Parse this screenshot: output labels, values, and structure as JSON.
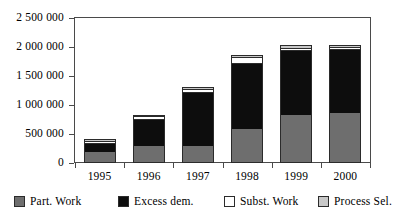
{
  "chart_data": {
    "type": "bar",
    "subtype": "stacked-bar",
    "title": "",
    "xlabel": "",
    "ylabel": "",
    "categories": [
      "1995",
      "1996",
      "1997",
      "1998",
      "1999",
      "2000"
    ],
    "ylim": [
      0,
      2500000
    ],
    "yticks": [
      0,
      500000,
      1000000,
      1500000,
      2000000,
      2500000
    ],
    "ytick_labels": [
      "0",
      "500 000",
      "1 000 000",
      "1 500 000",
      "2 000 000",
      "2 500 000"
    ],
    "grid": false,
    "legend_position": "bottom",
    "series": [
      {
        "name": "Part. Work",
        "color": "#6e6e6e",
        "values": [
          190000,
          300000,
          290000,
          590000,
          830000,
          870000
        ]
      },
      {
        "name": "Excess dem.",
        "color": "#0d0d0d",
        "values": [
          160000,
          460000,
          930000,
          1140000,
          1120000,
          1090000
        ]
      },
      {
        "name": "Subst. Work",
        "color": "#ffffff",
        "values": [
          30000,
          45000,
          60000,
          105000,
          40000,
          35000
        ]
      },
      {
        "name": "Process Sel.",
        "color": "#c8c8c8",
        "values": [
          30000,
          30000,
          25000,
          25000,
          45000,
          45000
        ]
      }
    ],
    "totals": [
      410000,
      835000,
      1305000,
      1860000,
      2035000,
      2040000
    ]
  },
  "axis": {
    "y_ticks": [
      {
        "label": "2 500 000",
        "value": 2500000
      },
      {
        "label": "2 000 000",
        "value": 2000000
      },
      {
        "label": "1 500 000",
        "value": 1500000
      },
      {
        "label": "1 000 000",
        "value": 1000000
      },
      {
        "label": "500 000",
        "value": 500000
      },
      {
        "label": "0",
        "value": 0
      }
    ],
    "x_ticks": [
      "1995",
      "1996",
      "1997",
      "1998",
      "1999",
      "2000"
    ]
  },
  "legend": {
    "items": [
      {
        "label": "Part. Work",
        "color": "#6e6e6e"
      },
      {
        "label": "Excess dem.",
        "color": "#0d0d0d"
      },
      {
        "label": "Subst. Work",
        "color": "#ffffff"
      },
      {
        "label": "Process Sel.",
        "color": "#c8c8c8"
      }
    ]
  },
  "colors": {
    "axis": "#4a4a4a",
    "outline": "#2b2b2b",
    "background": "#ffffff"
  }
}
